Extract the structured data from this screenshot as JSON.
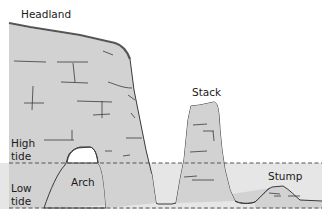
{
  "diagram": {
    "labels": {
      "headland": "Headland",
      "stack": "Stack",
      "high_tide_1": "High",
      "high_tide_2": "tide",
      "arch": "Arch",
      "low_tide_1": "Low",
      "low_tide_2": "tide",
      "stump": "Stump"
    },
    "colors": {
      "rock": "#d2d2d2",
      "water": "#e6e6e6",
      "outline": "#3a3a3a",
      "tide_line": "#555555",
      "background": "#ffffff"
    },
    "tide_levels": {
      "high_tide_y": 163,
      "low_tide_y": 208
    }
  }
}
